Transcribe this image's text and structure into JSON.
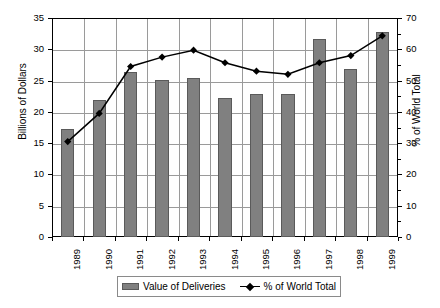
{
  "chart_data": {
    "type": "bar",
    "title": "",
    "subtitle": "",
    "xlabel": "",
    "ylabel": "Billions of Dollars",
    "y2label": "% of World Total",
    "categories": [
      "1989",
      "1990",
      "1991",
      "1992",
      "1993",
      "1994",
      "1995",
      "1996",
      "1997",
      "1998",
      "1999"
    ],
    "ylim": [
      0,
      35
    ],
    "y2lim": [
      0,
      70
    ],
    "yticks": [
      0,
      5,
      10,
      15,
      20,
      25,
      30,
      35
    ],
    "y2ticks": [
      0,
      10,
      20,
      30,
      40,
      50,
      60,
      70
    ],
    "grid": true,
    "legend_position": "bottom",
    "series": [
      {
        "name": "Value of Deliveries",
        "type": "bar",
        "axis": "left",
        "unit": "Billions of Dollars",
        "color": "#808080",
        "values": [
          17.2,
          21.9,
          26.3,
          25.1,
          25.4,
          22.2,
          22.9,
          22.8,
          31.7,
          26.8,
          32.8
        ]
      },
      {
        "name": "% of World Total",
        "type": "line",
        "axis": "right",
        "unit": "%",
        "color": "#000000",
        "marker": "diamond",
        "values": [
          30.5,
          39.5,
          54.5,
          57.5,
          59.7,
          55.7,
          53.0,
          52.0,
          55.7,
          58.0,
          64.3
        ]
      }
    ]
  },
  "legend": {
    "items": [
      {
        "label": "Value of Deliveries",
        "swatch": "bar-swatch"
      },
      {
        "label": "% of World Total",
        "swatch": "line-marker-swatch"
      }
    ]
  },
  "axes": {
    "left_title": "Billions of Dollars",
    "right_title": "% of World Total",
    "left_ticks": [
      "0",
      "5",
      "10",
      "15",
      "20",
      "25",
      "30",
      "35"
    ],
    "right_ticks": [
      "0",
      "10",
      "20",
      "30",
      "40",
      "50",
      "60",
      "70"
    ],
    "x_ticks": [
      "1989",
      "1990",
      "1991",
      "1992",
      "1993",
      "1994",
      "1995",
      "1996",
      "1997",
      "1998",
      "1999"
    ]
  },
  "colors": {
    "bar_fill": "#808080",
    "bar_stroke": "#5a5a5a",
    "line": "#000000",
    "grid": "#9a9a9a",
    "axis": "#000000",
    "background": "#ffffff"
  }
}
